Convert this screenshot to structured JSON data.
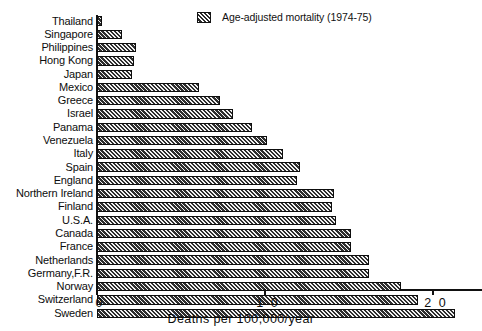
{
  "chart_data": {
    "type": "bar",
    "orientation": "horizontal",
    "title": "",
    "xlabel": "Deaths  per  100,000/year",
    "ylabel": "",
    "xlim": [
      0,
      23
    ],
    "grid": false,
    "legend": {
      "position": "top-right",
      "entries": [
        "Age-adjusted mortality (1974-75)"
      ]
    },
    "xticks": [
      0,
      10,
      20
    ],
    "xticklabels": [
      "0",
      "1 0",
      "2 0"
    ],
    "categories": [
      "Thailand",
      "Singapore",
      "Philippines",
      "Hong Kong",
      "Japan",
      "Mexico",
      "Greece",
      "Israel",
      "Panama",
      "Venezuela",
      "Italy",
      "Spain",
      "England",
      "Northern Ireland",
      "Finland",
      "U.S.A.",
      "Canada",
      "France",
      "Netherlands",
      "Germany,F.R.",
      "Norway",
      "Switzerland",
      "Sweden"
    ],
    "values": [
      0.3,
      1.5,
      2.3,
      2.2,
      2.1,
      6.1,
      7.3,
      8.1,
      9.2,
      10.1,
      11.1,
      12.1,
      11.9,
      14.1,
      14.0,
      14.2,
      15.1,
      15.1,
      16.2,
      16.2,
      18.1,
      19.1,
      21.3
    ],
    "series": [
      {
        "name": "Age-adjusted mortality (1974-75)",
        "values": [
          0.3,
          1.5,
          2.3,
          2.2,
          2.1,
          6.1,
          7.3,
          8.1,
          9.2,
          10.1,
          11.1,
          12.1,
          11.9,
          14.1,
          14.0,
          14.2,
          15.1,
          15.1,
          16.2,
          16.2,
          18.1,
          19.1,
          21.3
        ]
      }
    ],
    "colors": {
      "bar_fill": "#2e2e2e",
      "bar_hatch": "#f2f2f2",
      "axis": "#111111",
      "text": "#0d0d0d",
      "background": "#ffffff"
    }
  }
}
